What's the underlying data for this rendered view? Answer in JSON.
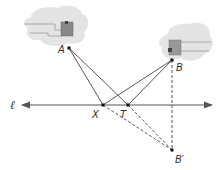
{
  "diagram": {
    "line_label": "ℓ",
    "points": {
      "A": {
        "label": "A"
      },
      "B": {
        "label": "B"
      },
      "X": {
        "label": "X"
      },
      "T": {
        "label": "T"
      },
      "Bprime": {
        "label": "B′"
      }
    },
    "segments_solid": [
      "AX",
      "XB",
      "AT",
      "TB"
    ],
    "segments_dashed": [
      "XB′",
      "TB′",
      "BB′"
    ],
    "colors": {
      "line": "#444444",
      "dashed": "#444444",
      "cloud": "#e2e2e2",
      "box": "#8a8a8a",
      "box_dark": "#555555"
    }
  }
}
